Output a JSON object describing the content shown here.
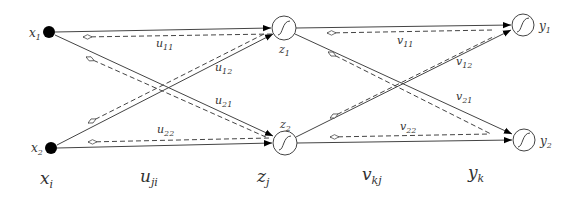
{
  "diagram": {
    "colors": {
      "line": "#444444",
      "text": "#333333",
      "input_node": "#000000",
      "background": "#ffffff"
    },
    "inputs": [
      {
        "id": "x1",
        "label": "x",
        "sub": "1",
        "cx": 49,
        "cy": 32
      },
      {
        "id": "x2",
        "label": "x",
        "sub": "2",
        "cx": 51,
        "cy": 148
      }
    ],
    "hidden": [
      {
        "id": "z1",
        "label": "z",
        "sub": "1",
        "cx": 284,
        "cy": 28,
        "icon": "sigmoid-icon"
      },
      {
        "id": "z2",
        "label": "z",
        "sub": "2",
        "cx": 285,
        "cy": 143,
        "icon": "sigmoid-icon"
      }
    ],
    "outputs": [
      {
        "id": "y1",
        "label": "y",
        "sub": "1",
        "cx": 523,
        "cy": 25,
        "icon": "sigmoid-icon"
      },
      {
        "id": "y2",
        "label": "y",
        "sub": "2",
        "cx": 524,
        "cy": 140,
        "icon": "sigmoid-icon"
      }
    ],
    "weights_u": [
      {
        "label": "u",
        "sub": "11"
      },
      {
        "label": "u",
        "sub": "12"
      },
      {
        "label": "u",
        "sub": "21"
      },
      {
        "label": "u",
        "sub": "22"
      }
    ],
    "weights_v": [
      {
        "label": "v",
        "sub": "11"
      },
      {
        "label": "v",
        "sub": "12"
      },
      {
        "label": "v",
        "sub": "21"
      },
      {
        "label": "v",
        "sub": "22"
      }
    ],
    "layer_labels": [
      {
        "label": "x",
        "sub": "i"
      },
      {
        "label": "u",
        "sub": "ji"
      },
      {
        "label": "z",
        "sub": "j"
      },
      {
        "label": "v",
        "sub": "kj"
      },
      {
        "label": "y",
        "sub": "k"
      }
    ]
  }
}
